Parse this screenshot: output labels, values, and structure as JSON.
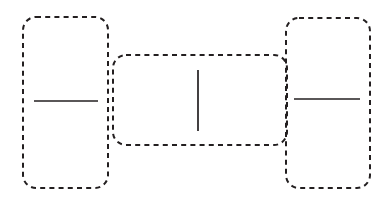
{
  "figure": {
    "background_color": "#ffffff",
    "stroke_color": "#231f20",
    "width": 391,
    "height": 199
  },
  "style": {
    "box_stroke_width": 2,
    "box_dash": "5 4.2",
    "box_corner_radius": 13,
    "segment_stroke_width": 1.7
  },
  "boxes": [
    {
      "id": "left-box",
      "label": "left dashed rounded rectangle",
      "x": 23,
      "y": 17,
      "width": 85,
      "height": 171,
      "rx": 13
    },
    {
      "id": "middle-box",
      "label": "middle dashed rounded rectangle",
      "x": 113,
      "y": 55,
      "width": 174,
      "height": 90,
      "rx": 13
    },
    {
      "id": "right-box",
      "label": "right dashed rounded rectangle",
      "x": 286,
      "y": 18,
      "width": 84,
      "height": 170,
      "rx": 13
    }
  ],
  "segments": [
    {
      "id": "left-horizontal-segment",
      "label": "horizontal line in left box",
      "orientation": "horizontal",
      "x1": 34,
      "y1": 101,
      "x2": 98,
      "y2": 101
    },
    {
      "id": "middle-vertical-segment",
      "label": "vertical line in middle box",
      "orientation": "vertical",
      "x1": 198,
      "y1": 70,
      "x2": 198,
      "y2": 131
    },
    {
      "id": "right-horizontal-segment",
      "label": "horizontal line in right box",
      "orientation": "horizontal",
      "x1": 294,
      "y1": 99,
      "x2": 360,
      "y2": 99
    }
  ]
}
